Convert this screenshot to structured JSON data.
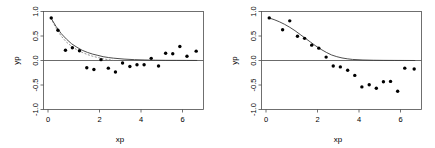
{
  "figure": {
    "background": "#ffffff",
    "width": 435,
    "height": 148,
    "panel_count": 2
  },
  "chart_data": [
    {
      "panel": "left",
      "type": "scatter",
      "title": "",
      "xlabel": "xp",
      "ylabel": "yp",
      "xlim": [
        -0.35,
        7.3
      ],
      "ylim": [
        -1.15,
        1.15
      ],
      "xticks": [
        0,
        2,
        4,
        6
      ],
      "xticklabels": [
        "0",
        "2",
        "4",
        "6"
      ],
      "yticks": [
        -1.0,
        -0.5,
        0.0,
        0.5,
        1.0
      ],
      "yticklabels": [
        "-1.0",
        "-0.5",
        "0.0",
        "0.5",
        "1.0"
      ],
      "grid": false,
      "legend": null,
      "zero_reference_line": 0.0,
      "point_color": "#000000",
      "curve_color": "#3a3a3a",
      "points": [
        {
          "x": 0.02,
          "y": 1.0
        },
        {
          "x": 0.34,
          "y": 0.71
        },
        {
          "x": 0.7,
          "y": 0.24
        },
        {
          "x": 1.03,
          "y": 0.3
        },
        {
          "x": 1.37,
          "y": 0.23
        },
        {
          "x": 1.72,
          "y": -0.17
        },
        {
          "x": 2.06,
          "y": -0.21
        },
        {
          "x": 2.4,
          "y": 0.02
        },
        {
          "x": 2.75,
          "y": -0.18
        },
        {
          "x": 3.09,
          "y": -0.27
        },
        {
          "x": 3.43,
          "y": -0.06
        },
        {
          "x": 3.78,
          "y": -0.14
        },
        {
          "x": 4.12,
          "y": -0.1
        },
        {
          "x": 4.46,
          "y": -0.1
        },
        {
          "x": 4.8,
          "y": 0.05
        },
        {
          "x": 5.15,
          "y": -0.13
        },
        {
          "x": 5.49,
          "y": 0.17
        },
        {
          "x": 5.83,
          "y": 0.16
        },
        {
          "x": 6.17,
          "y": 0.33
        },
        {
          "x": 6.51,
          "y": 0.1
        },
        {
          "x": 6.95,
          "y": 0.22
        }
      ],
      "series": [
        {
          "name": "fitted-curve-solid",
          "style": "solid",
          "model": "exponential-decay",
          "x": [
            0.0,
            0.25,
            0.5,
            0.75,
            1.0,
            1.25,
            1.5,
            1.75,
            2.0,
            2.25,
            2.5,
            2.75,
            3.0,
            3.5,
            4.0,
            4.5,
            5.0,
            5.5,
            6.0,
            6.5,
            7.0
          ],
          "y": [
            1.0,
            0.8,
            0.63,
            0.5,
            0.39,
            0.31,
            0.24,
            0.19,
            0.15,
            0.12,
            0.09,
            0.07,
            0.055,
            0.033,
            0.02,
            0.012,
            0.007,
            0.004,
            0.003,
            0.002,
            0.001
          ]
        },
        {
          "name": "fitted-curve-dashed",
          "style": "dashed",
          "model": "exponential-decay-alt",
          "x": [
            0.0,
            0.25,
            0.5,
            0.75,
            1.0,
            1.25,
            1.5,
            1.75,
            2.0,
            2.25,
            2.5,
            2.75,
            3.0
          ],
          "y": [
            1.0,
            0.76,
            0.57,
            0.43,
            0.33,
            0.25,
            0.19,
            0.14,
            0.1,
            0.07,
            0.04,
            0.02,
            0.0
          ]
        }
      ]
    },
    {
      "panel": "right",
      "type": "scatter",
      "title": "",
      "xlabel": "xp",
      "ylabel": "yp",
      "xlim": [
        -0.35,
        7.3
      ],
      "ylim": [
        -1.15,
        1.15
      ],
      "xticks": [
        0,
        2,
        4,
        6
      ],
      "xticklabels": [
        "0",
        "2",
        "4",
        "6"
      ],
      "yticks": [
        -1.0,
        -0.5,
        0.0,
        0.5,
        1.0
      ],
      "yticklabels": [
        "-1.0",
        "-0.5",
        "0.0",
        "0.5",
        "1.0"
      ],
      "grid": false,
      "legend": null,
      "zero_reference_line": 0.0,
      "point_color": "#000000",
      "curve_color": "#3a3a3a",
      "points": [
        {
          "x": 0.02,
          "y": 1.0
        },
        {
          "x": 0.66,
          "y": 0.72
        },
        {
          "x": 1.0,
          "y": 0.93
        },
        {
          "x": 1.37,
          "y": 0.57
        },
        {
          "x": 1.71,
          "y": 0.52
        },
        {
          "x": 2.05,
          "y": 0.36
        },
        {
          "x": 2.39,
          "y": 0.29
        },
        {
          "x": 2.74,
          "y": 0.08
        },
        {
          "x": 3.08,
          "y": -0.13
        },
        {
          "x": 3.42,
          "y": -0.15
        },
        {
          "x": 3.77,
          "y": -0.23
        },
        {
          "x": 4.11,
          "y": -0.35
        },
        {
          "x": 4.45,
          "y": -0.62
        },
        {
          "x": 4.8,
          "y": -0.57
        },
        {
          "x": 5.14,
          "y": -0.65
        },
        {
          "x": 5.48,
          "y": -0.5
        },
        {
          "x": 5.82,
          "y": -0.49
        },
        {
          "x": 6.16,
          "y": -0.72
        },
        {
          "x": 6.5,
          "y": -0.18
        },
        {
          "x": 6.95,
          "y": -0.2
        }
      ],
      "series": [
        {
          "name": "fitted-curve-solid",
          "style": "solid",
          "model": "sigmoid-decay",
          "x": [
            0.0,
            0.25,
            0.5,
            0.75,
            1.0,
            1.25,
            1.5,
            1.75,
            2.0,
            2.25,
            2.5,
            2.75,
            3.0,
            3.25,
            3.5,
            3.75,
            4.0,
            4.5,
            5.0,
            5.5,
            6.0,
            6.5,
            7.0
          ],
          "y": [
            1.0,
            0.96,
            0.91,
            0.85,
            0.78,
            0.7,
            0.61,
            0.52,
            0.43,
            0.34,
            0.26,
            0.19,
            0.13,
            0.09,
            0.06,
            0.04,
            0.025,
            0.012,
            0.006,
            0.003,
            0.002,
            0.001,
            0.0
          ]
        }
      ]
    }
  ]
}
